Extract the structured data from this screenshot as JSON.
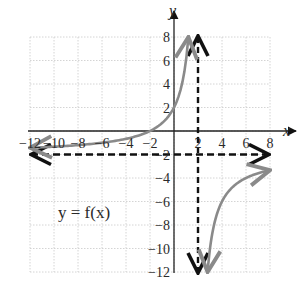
{
  "chart_data": {
    "type": "line",
    "title": "",
    "xlabel": "x",
    "ylabel": "y",
    "xlim": [
      -12,
      8
    ],
    "ylim": [
      -12,
      8
    ],
    "grid": true,
    "grid_step": 2,
    "x_ticks": [
      "-12",
      "-10",
      "-8",
      "-6",
      "-4",
      "-2",
      "2",
      "4",
      "6",
      "8"
    ],
    "y_ticks": [
      "8",
      "6",
      "4",
      "2",
      "-2",
      "-4",
      "-6",
      "-8",
      "-10",
      "-12"
    ],
    "x_tick_values": [
      -12,
      -10,
      -8,
      -6,
      -4,
      -2,
      2,
      4,
      6,
      8
    ],
    "y_tick_values": [
      8,
      6,
      4,
      2,
      -2,
      -4,
      -6,
      -8,
      -10,
      -12
    ],
    "annotation": "y = f(x)",
    "function_label": "y = f(x)",
    "asymptotes": [
      {
        "type": "vertical",
        "x": 2,
        "style": "dashed",
        "color": "#111111"
      },
      {
        "type": "horizontal",
        "y": -2,
        "style": "dashed",
        "color": "#111111"
      }
    ],
    "series": [
      {
        "name": "f(x) left branch",
        "color": "#8a8a8a",
        "points": [
          [
            -12,
            -1.43
          ],
          [
            -10,
            -1.33
          ],
          [
            -8,
            -1.2
          ],
          [
            -6,
            -1.0
          ],
          [
            -4,
            -0.67
          ],
          [
            -2,
            0.0
          ],
          [
            -1,
            0.67
          ],
          [
            0,
            2.0
          ],
          [
            0.5,
            3.33
          ],
          [
            1.0,
            6.0
          ],
          [
            1.2,
            8.0
          ]
        ]
      },
      {
        "name": "f(x) right branch",
        "color": "#8a8a8a",
        "points": [
          [
            2.8,
            -12.0
          ],
          [
            3.0,
            -10.0
          ],
          [
            3.33,
            -8.0
          ],
          [
            4.0,
            -6.0
          ],
          [
            5.0,
            -4.67
          ],
          [
            6.0,
            -4.0
          ],
          [
            7.0,
            -3.6
          ],
          [
            8.0,
            -3.33
          ]
        ]
      }
    ]
  }
}
